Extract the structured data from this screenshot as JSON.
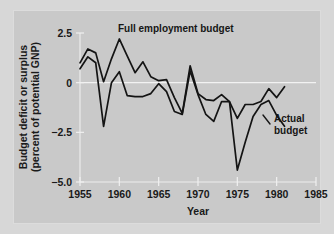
{
  "figure": {
    "background_color": "#d7d7d7",
    "plot_background_color": "#c9c9c9",
    "line_color": "#141414",
    "grid_color": "#eeeeee"
  },
  "annotations": {
    "full_employment_label": "Full employment budget",
    "actual_label_line1": "Actual",
    "actual_label_line2": "budget"
  },
  "axis": {
    "ylabel_line1": "Budget deficit or surplus",
    "ylabel_line2": "(percent of potential GNP)",
    "xlabel": "Year",
    "ytick_labels": [
      "2.5",
      "0",
      "−2.5",
      "−5.0"
    ],
    "xtick_labels": [
      "1955",
      "1960",
      "1965",
      "1970",
      "1975",
      "1980",
      "1985"
    ]
  },
  "chart_data": {
    "type": "line",
    "title": "",
    "xlabel": "Year",
    "ylabel": "Budget deficit or surplus (percent of potential GNP)",
    "xlim": [
      1955,
      1985
    ],
    "ylim": [
      -5.0,
      2.5
    ],
    "yticks": [
      2.5,
      0,
      -2.5,
      -5.0
    ],
    "xticks": [
      1955,
      1960,
      1965,
      1970,
      1975,
      1980,
      1985
    ],
    "grid": false,
    "legend": "annotated-inline",
    "x": [
      1955,
      1956,
      1957,
      1958,
      1959,
      1960,
      1961,
      1962,
      1963,
      1964,
      1965,
      1966,
      1967,
      1968,
      1969,
      1970,
      1971,
      1972,
      1973,
      1974,
      1975,
      1976,
      1977,
      1978,
      1979,
      1980,
      1981
    ],
    "series": [
      {
        "name": "Full employment budget",
        "values": [
          1.0,
          1.7,
          1.5,
          0.05,
          1.2,
          2.2,
          1.35,
          0.5,
          1.05,
          0.3,
          0.1,
          0.15,
          -0.75,
          -1.55,
          0.85,
          -0.55,
          -0.85,
          -0.9,
          -0.6,
          -0.95,
          -1.8,
          -1.1,
          -1.1,
          -0.95,
          -0.3,
          -0.75,
          -0.2
        ],
        "color": "#141414"
      },
      {
        "name": "Actual budget",
        "values": [
          0.7,
          1.3,
          1.0,
          -2.2,
          0.0,
          0.55,
          -0.65,
          -0.7,
          -0.7,
          -0.55,
          -0.05,
          -0.45,
          -1.45,
          -1.6,
          0.6,
          -0.6,
          -1.6,
          -1.95,
          -0.95,
          -0.95,
          -4.4,
          -3.0,
          -1.7,
          -1.1,
          -0.9,
          -1.65,
          -2.2
        ],
        "color": "#141414"
      }
    ]
  }
}
